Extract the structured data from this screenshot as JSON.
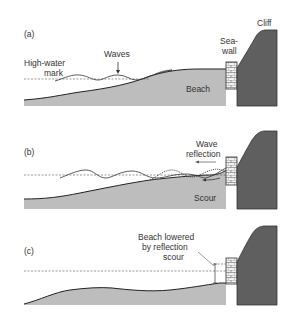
{
  "colors": {
    "cliff": "#5f5f5f",
    "beach": "#bdbdbd",
    "seawall_fill": "#f2f2f2",
    "line": "#333333"
  },
  "panels": [
    {
      "id": "a",
      "label": "(a)",
      "annotations": {
        "cliff": "Cliff",
        "seawall_line1": "Sea-",
        "seawall_line2": "wall",
        "waves": "Waves",
        "hwm_line1": "High-water",
        "hwm_line2": "mark",
        "beach": "Beach"
      }
    },
    {
      "id": "b",
      "label": "(b)",
      "annotations": {
        "reflection_line1": "Wave",
        "reflection_line2": "reflection",
        "scour": "Scour"
      }
    },
    {
      "id": "c",
      "label": "(c)",
      "annotations": {
        "lowered_line1": "Beach lowered",
        "lowered_line2": "by reflection",
        "lowered_line3": "scour"
      }
    }
  ]
}
